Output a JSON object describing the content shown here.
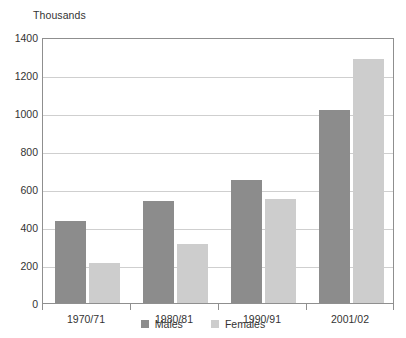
{
  "chart_data": {
    "type": "bar",
    "title": "",
    "subtitle": "",
    "unit_caption": "Thousands",
    "categories": [
      "1970/71",
      "1980/81",
      "1990/91",
      "2001/02"
    ],
    "series": [
      {
        "name": "Males",
        "color": "#8c8c8c",
        "values": [
          430,
          537,
          650,
          1015
        ]
      },
      {
        "name": "Females",
        "color": "#cdcdcd",
        "values": [
          212,
          310,
          545,
          1285
        ]
      }
    ],
    "xlabel": "",
    "ylabel": "Thousands",
    "ylim": [
      0,
      1400
    ],
    "ytick_values": [
      0,
      200,
      400,
      600,
      800,
      1000,
      1200,
      1400
    ],
    "ytick_labels": [
      "0",
      "200",
      "400",
      "600",
      "800",
      "1000",
      "1200",
      "1400"
    ],
    "grid": true,
    "grid_axis": "y",
    "legend_position": "bottom-center",
    "legend_entries": [
      "Males",
      "Females"
    ],
    "annotations": []
  },
  "style": {
    "background": "#ffffff",
    "plot_border": "#8f8f8f",
    "gridline": "#cfcfcf",
    "text": "#333333"
  }
}
